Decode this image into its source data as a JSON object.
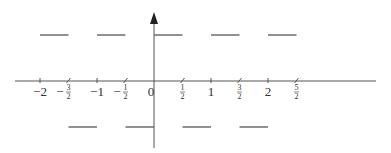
{
  "diagram": {
    "type": "step-function-graph",
    "colors": {
      "line": "#555555",
      "text": "#333333",
      "background": "#ffffff"
    },
    "x_axis": {
      "ticks": [
        {
          "value": -2,
          "label": "−2",
          "kind": "integer"
        },
        {
          "value": -1.5,
          "label_sign": "−",
          "num": "3",
          "den": "2",
          "kind": "fraction"
        },
        {
          "value": -1,
          "label": "−1",
          "kind": "integer"
        },
        {
          "value": -0.5,
          "label_sign": "−",
          "num": "1",
          "den": "2",
          "kind": "fraction"
        },
        {
          "value": 0,
          "label": "0",
          "kind": "integer"
        },
        {
          "value": 0.5,
          "label_sign": "",
          "num": "1",
          "den": "2",
          "kind": "fraction"
        },
        {
          "value": 1,
          "label": "1",
          "kind": "integer"
        },
        {
          "value": 1.5,
          "label_sign": "",
          "num": "3",
          "den": "2",
          "kind": "fraction"
        },
        {
          "value": 2,
          "label": "2",
          "kind": "integer"
        },
        {
          "value": 2.5,
          "label_sign": "",
          "num": "5",
          "den": "2",
          "kind": "fraction"
        }
      ]
    },
    "y_axis": {
      "arrow": "up"
    },
    "segments": [
      {
        "x0": -2,
        "x1": -1.5,
        "y": 1
      },
      {
        "x0": -1.5,
        "x1": -1,
        "y": -1
      },
      {
        "x0": -1,
        "x1": -0.5,
        "y": 1
      },
      {
        "x0": -0.5,
        "x1": 0,
        "y": -1
      },
      {
        "x0": 0,
        "x1": 0.5,
        "y": 1
      },
      {
        "x0": 0.5,
        "x1": 1,
        "y": -1
      },
      {
        "x0": 1,
        "x1": 1.5,
        "y": 1
      },
      {
        "x0": 1.5,
        "x1": 2,
        "y": -1
      },
      {
        "x0": 2,
        "x1": 2.5,
        "y": 1
      }
    ]
  }
}
